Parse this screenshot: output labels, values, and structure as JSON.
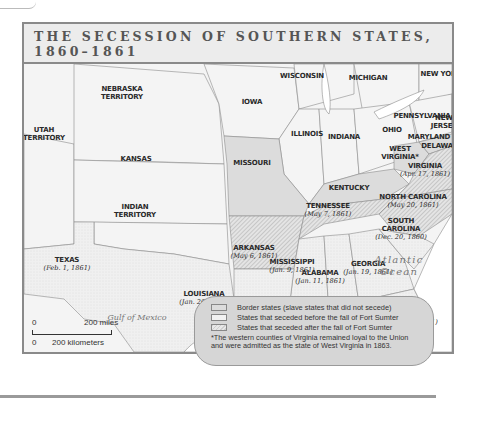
{
  "title": {
    "line1": "THE SECESSION OF SOUTHERN STATES,",
    "line2": "1860–1861"
  },
  "colors": {
    "frame": "#8a8a8a",
    "title_bg": "#ececec",
    "border_state_fill": "#dcdcdc",
    "seceded_before_fill": "#f2f2f2",
    "seceded_after_hatch": "#c8c8c8",
    "territory_fill": "#f4f4f4",
    "water": "#ffffff",
    "legend_bg": "#d6d6d6"
  },
  "states": {
    "nebraska": {
      "name_1": "NEBRASKA",
      "name_2": "TERRITORY"
    },
    "iowa": {
      "name": "IOWA"
    },
    "wisconsin": {
      "name": "WISCONSIN"
    },
    "michigan": {
      "name": "MICHIGAN"
    },
    "new_york": {
      "name": "NEW YORK"
    },
    "utah": {
      "name_1": "UTAH",
      "name_2": "TERRITORY"
    },
    "kansas": {
      "name": "KANSAS"
    },
    "missouri": {
      "name": "MISSOURI"
    },
    "illinois": {
      "name": "ILLINOIS"
    },
    "indiana": {
      "name": "INDIANA"
    },
    "ohio": {
      "name": "OHIO"
    },
    "pennsylvania": {
      "name": "PENNSYLVANIA"
    },
    "new_jersey": {
      "name_1": "NEW",
      "name_2": "JERSEY"
    },
    "maryland": {
      "name": "MARYLAND"
    },
    "delaware": {
      "name": "DELAWARE"
    },
    "west_virginia": {
      "name_1": "WEST",
      "name_2": "VIRGINIA*"
    },
    "virginia": {
      "name": "VIRGINIA",
      "date": "(Apr. 17, 1861)"
    },
    "kentucky": {
      "name": "KENTUCKY"
    },
    "indian_territory": {
      "name_1": "INDIAN",
      "name_2": "TERRITORY"
    },
    "arkansas": {
      "name": "ARKANSAS",
      "date": "(May 6, 1861)"
    },
    "tennessee": {
      "name": "TENNESSEE",
      "date": "(May 7, 1861)"
    },
    "north_carolina": {
      "name": "NORTH CAROLINA",
      "date": "(May 20, 1861)"
    },
    "south_carolina": {
      "name_1": "SOUTH",
      "name_2": "CAROLINA",
      "date": "(Dec. 20, 1860)"
    },
    "mississippi": {
      "name": "MISSISSIPPI",
      "date": "(Jan. 9, 1861)"
    },
    "alabama": {
      "name": "ALABAMA",
      "date": "(Jan. 11, 1861)"
    },
    "georgia": {
      "name": "GEORGIA",
      "date": "(Jan. 19, 1861)"
    },
    "texas": {
      "name": "TEXAS",
      "date": "(Feb. 1, 1861)"
    },
    "louisiana": {
      "name": "LOUISIANA",
      "date": "(Jan. 26, 1861)"
    },
    "florida": {
      "name": "FLORIDA",
      "date": "(Jan. 10, 1861)"
    }
  },
  "water": {
    "atlantic_1": "Atlantic",
    "atlantic_2": "Ocean",
    "gulf": "Gulf of Mexico"
  },
  "legend": {
    "items": [
      {
        "label": "Border states (slave states that did not secede)"
      },
      {
        "label": "States that seceded before the fall of Fort Sumter"
      },
      {
        "label": "States that seceded after the fall of Fort Sumter"
      }
    ],
    "note_1": "*The western counties of Virginia remained loyal to the Union",
    "note_2": "and were admitted as the state of West Virginia in 1863."
  },
  "scale": {
    "zero_top": "0",
    "miles": "200 miles",
    "zero_bottom": "0",
    "km": "200 kilometers"
  }
}
